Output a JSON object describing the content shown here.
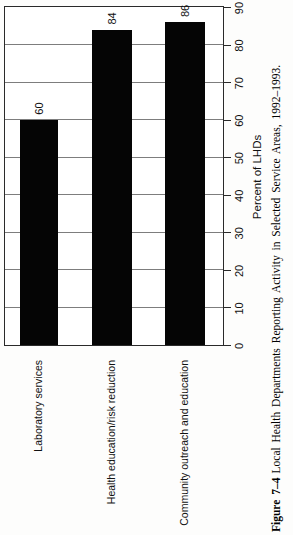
{
  "figure": {
    "caption_label": "Figure 7–4",
    "caption_text": "Local Health Departments Reporting Activity in Selected Service Areas, 1992–1993."
  },
  "chart_data": {
    "type": "bar",
    "orientation": "horizontal",
    "rotated_90_ccw": true,
    "title": "",
    "categories": [
      "Laboratory services",
      "Health education/risk reduction",
      "Community outreach and education"
    ],
    "values": [
      60,
      84,
      86
    ],
    "value_labels": [
      "60",
      "84",
      "86"
    ],
    "xlabel": "Percent of LHDs",
    "ylabel": "",
    "xlim": [
      0,
      90
    ],
    "xticks": [
      0,
      10,
      20,
      30,
      40,
      50,
      60,
      70,
      80,
      90
    ],
    "grid": true,
    "legend": "none",
    "bar_color": "#050505",
    "gridline_color": "#7d7d7d",
    "axis_color": "#2a2a2a"
  }
}
